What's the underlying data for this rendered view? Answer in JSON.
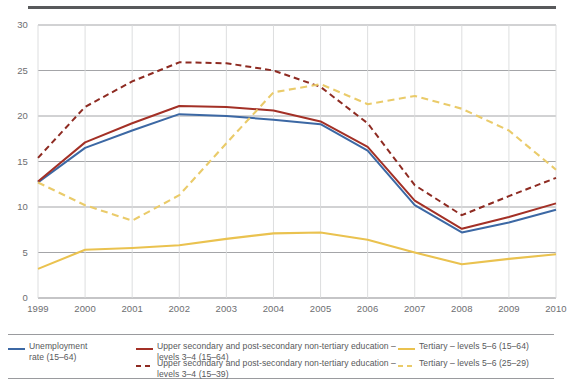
{
  "chart_data": {
    "type": "line",
    "title": "",
    "subtitle": "",
    "xlabel": "",
    "ylabel": "",
    "xlim": [
      1999,
      2010
    ],
    "ylim": [
      0,
      30
    ],
    "yticks": [
      0,
      5,
      10,
      15,
      20,
      25,
      30
    ],
    "grid": true,
    "legend_position": "bottom",
    "categories": [
      "1999",
      "2000",
      "2001",
      "2002",
      "2003",
      "2004",
      "2005",
      "2006",
      "2007",
      "2008",
      "2009",
      "2010"
    ],
    "x": [
      1999,
      2000,
      2001,
      2002,
      2003,
      2004,
      2005,
      2006,
      2007,
      2008,
      2009,
      2010
    ],
    "series": [
      {
        "name": "Unemployment rate (15–64)",
        "style": "solid",
        "color": "#3C68A4",
        "values": [
          12.7,
          16.5,
          18.4,
          20.2,
          20.0,
          19.6,
          19.1,
          16.2,
          10.2,
          7.2,
          8.3,
          9.7
        ]
      },
      {
        "name": "Upper secondary and post-secondary non-tertiary education – levels 3–4 (15–64)",
        "style": "solid",
        "color": "#A33026",
        "values": [
          12.8,
          17.1,
          19.2,
          21.1,
          21.0,
          20.6,
          19.4,
          16.6,
          10.7,
          7.6,
          8.9,
          10.4
        ]
      },
      {
        "name": "Upper secondary and post-secondary non-tertiary education – levels 3–4 (15–39)",
        "style": "dashed",
        "color": "#8E2B22",
        "values": [
          15.4,
          21.0,
          23.8,
          25.9,
          25.8,
          25.0,
          23.2,
          19.2,
          12.4,
          9.1,
          11.2,
          13.2
        ]
      },
      {
        "name": "Tertiary – levels 5–6 (15–64)",
        "style": "solid",
        "color": "#EAC24F",
        "values": [
          3.2,
          5.3,
          5.5,
          5.8,
          6.5,
          7.1,
          7.2,
          6.4,
          5.0,
          3.7,
          4.3,
          4.8
        ]
      },
      {
        "name": "Tertiary – levels 5–6 (25–29)",
        "style": "dashed",
        "color": "#EACB6A",
        "values": [
          12.7,
          10.2,
          8.5,
          11.3,
          17.0,
          22.6,
          23.5,
          21.3,
          22.2,
          20.8,
          18.4,
          14.1
        ]
      }
    ]
  },
  "axes": {
    "y_ticks": [
      "0",
      "5",
      "10",
      "15",
      "20",
      "25",
      "30"
    ],
    "x_ticks": [
      "1999",
      "2000",
      "2001",
      "2002",
      "2003",
      "2004",
      "2005",
      "2006",
      "2007",
      "2008",
      "2009",
      "2010"
    ]
  },
  "legend": {
    "items": [
      {
        "key": "unemployment-rate",
        "label": "Unemployment\nrate (15–64)",
        "style": "solid",
        "color": "#3C68A4"
      },
      {
        "key": "upper-secondary-15-64",
        "label": "Upper secondary and post-secondary non-tertiary education – levels 3–4 (15–64)",
        "style": "solid",
        "color": "#A33026"
      },
      {
        "key": "tertiary-15-64",
        "label": "Tertiary – levels 5–6 (15–64)",
        "style": "solid",
        "color": "#EAC24F"
      },
      {
        "key": "upper-secondary-15-39",
        "label": "Upper secondary and post-secondary non-tertiary education – levels 3–4 (15–39)",
        "style": "dashed",
        "color": "#8E2B22"
      },
      {
        "key": "tertiary-25-29",
        "label": "Tertiary – levels 5–6 (25–29)",
        "style": "dashed",
        "color": "#EACB6A"
      }
    ]
  },
  "colors": {
    "blue": "#3C68A4",
    "dark_red": "#A33026",
    "dark_red_dash": "#8E2B22",
    "yellow": "#EAC24F",
    "yellow_dash": "#EACB6A",
    "grid": "#9a9b9e",
    "rule": "#58595b",
    "text": "#6d6e71"
  }
}
